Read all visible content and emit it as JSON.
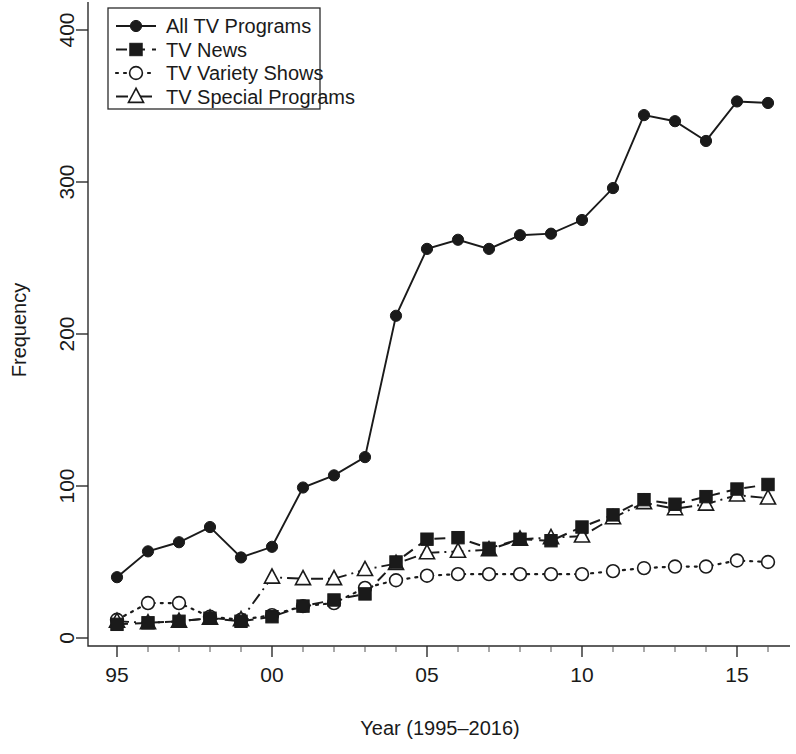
{
  "chart_data": {
    "type": "line",
    "title": "",
    "xlabel": "Year (1995–2016)",
    "ylabel": "Frequency",
    "xlim": [
      1994.4,
      2016.6
    ],
    "ylim": [
      0,
      420
    ],
    "grid": false,
    "legend_position": "top-left",
    "x": [
      1995,
      1996,
      1997,
      1998,
      1999,
      2000,
      2001,
      2002,
      2003,
      2004,
      2005,
      2006,
      2007,
      2008,
      2009,
      2010,
      2011,
      2012,
      2013,
      2014,
      2015,
      2016
    ],
    "xtick_values": [
      1995,
      2000,
      2005,
      2010,
      2015
    ],
    "xtick_labels": [
      "95",
      "00",
      "05",
      "10",
      "15"
    ],
    "ytick_values": [
      0,
      100,
      200,
      300,
      400
    ],
    "ytick_labels": [
      "0",
      "100",
      "200",
      "300",
      "400"
    ],
    "series": [
      {
        "name": "All TV Programs",
        "marker": "filled-circle",
        "linestyle": "solid",
        "values": [
          40,
          57,
          63,
          73,
          53,
          60,
          99,
          107,
          119,
          212,
          256,
          262,
          256,
          265,
          266,
          275,
          296,
          344,
          340,
          327,
          353,
          352
        ]
      },
      {
        "name": "TV News",
        "marker": "filled-square",
        "linestyle": "dashed",
        "values": [
          9,
          10,
          11,
          13,
          11,
          14,
          21,
          25,
          29,
          50,
          65,
          66,
          59,
          65,
          64,
          73,
          81,
          91,
          88,
          93,
          98,
          101
        ]
      },
      {
        "name": "TV Variety Shows",
        "marker": "open-circle",
        "linestyle": "dotted",
        "values": [
          12,
          23,
          23,
          14,
          12,
          15,
          21,
          23,
          33,
          38,
          41,
          42,
          42,
          42,
          42,
          42,
          44,
          46,
          47,
          47,
          51,
          50
        ]
      },
      {
        "name": "TV Special Programs",
        "marker": "open-triangle",
        "linestyle": "dashdot",
        "values": [
          11,
          10,
          11,
          13,
          12,
          40,
          39,
          39,
          45,
          49,
          56,
          57,
          58,
          65,
          66,
          67,
          79,
          89,
          85,
          88,
          94,
          92
        ]
      }
    ]
  },
  "legend": {
    "entries": [
      {
        "label": "All TV Programs"
      },
      {
        "label": "TV News"
      },
      {
        "label": "TV Variety Shows"
      },
      {
        "label": "TV Special Programs"
      }
    ]
  },
  "colors": {
    "ink": "#1a1a1a",
    "axis": "#2b2b2b",
    "background": "#ffffff"
  }
}
